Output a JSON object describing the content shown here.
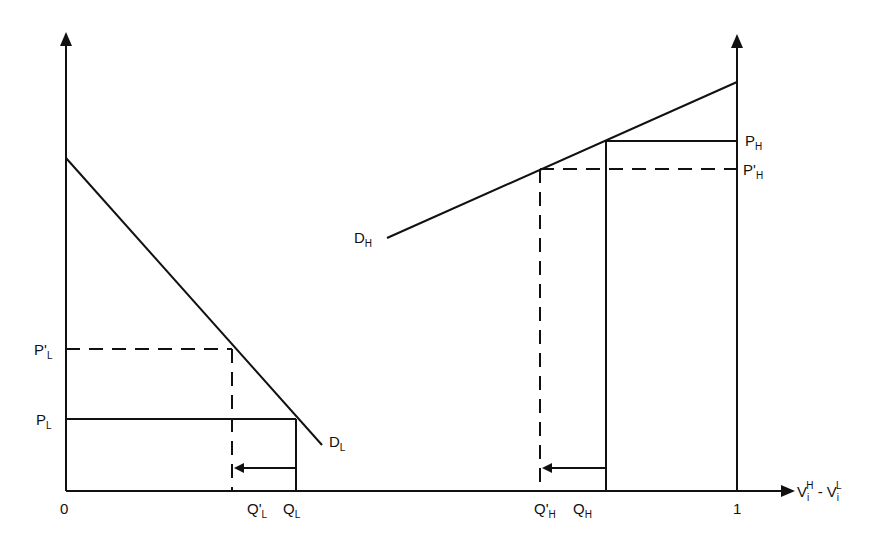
{
  "diagram": {
    "type": "economics-two-market-demand",
    "colors": {
      "line": "#111111",
      "background": "#ffffff"
    },
    "axes": {
      "origin_label": "0",
      "x_tick_label": "1",
      "x_axis_label": {
        "base1": "V",
        "sub1": "i",
        "sup1": "H",
        "minus": " - ",
        "base2": "V",
        "sub2": "i",
        "sup2": "L"
      }
    },
    "left_panel": {
      "demand_label": {
        "base": "D",
        "sub": "L"
      },
      "price_labels": [
        {
          "base": "P'",
          "sub": "L",
          "style": "dashed"
        },
        {
          "base": "P",
          "sub": "L",
          "style": "solid"
        }
      ],
      "quantity_labels": [
        {
          "base": "Q'",
          "sub": "L",
          "style": "dashed"
        },
        {
          "base": "Q",
          "sub": "L",
          "style": "solid"
        }
      ],
      "shift_arrow": "from Q_L to Q'_L (leftward)"
    },
    "right_panel": {
      "demand_label": {
        "base": "D",
        "sub": "H"
      },
      "price_labels": [
        {
          "base": "P",
          "sub": "H",
          "style": "solid"
        },
        {
          "base": "P'",
          "sub": "H",
          "style": "dashed"
        }
      ],
      "quantity_labels": [
        {
          "base": "Q'",
          "sub": "H",
          "style": "dashed"
        },
        {
          "base": "Q",
          "sub": "H",
          "style": "solid"
        }
      ],
      "shift_arrow": "from Q_H to Q'_H (leftward)"
    }
  }
}
